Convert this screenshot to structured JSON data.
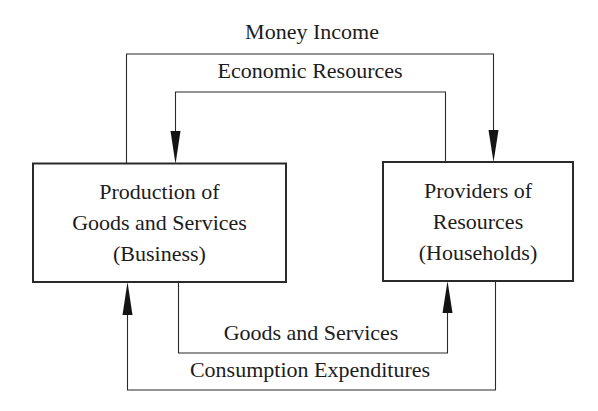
{
  "diagram": {
    "nodes": [
      {
        "id": "business",
        "lines": [
          "Production of",
          "Goods and Services",
          "(Business)"
        ]
      },
      {
        "id": "households",
        "lines": [
          "Providers of",
          "Resources",
          "(Households)"
        ]
      }
    ],
    "flows": [
      {
        "id": "money-income",
        "label": "Money Income",
        "from": "business",
        "to": "households",
        "path": "outer-top"
      },
      {
        "id": "economic-resources",
        "label": "Economic Resources",
        "from": "households",
        "to": "business",
        "path": "inner-top"
      },
      {
        "id": "goods-and-services",
        "label": "Goods and Services",
        "from": "business",
        "to": "households",
        "path": "inner-bottom"
      },
      {
        "id": "consumption-expenditures",
        "label": "Consumption Expenditures",
        "from": "households",
        "to": "business",
        "path": "outer-bottom"
      }
    ],
    "colors": {
      "line": "#2a2a2a",
      "text": "#1c1c1c",
      "background": "#ffffff"
    }
  }
}
